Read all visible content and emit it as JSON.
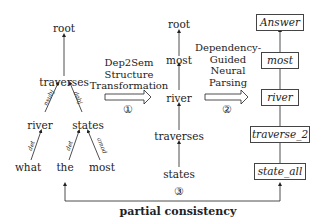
{
  "dependency_tree": {
    "nodes": {
      "root": "root",
      "traverses": "traverses",
      "river": "river",
      "states": "states",
      "what": "what",
      "the": "the",
      "most": "most"
    },
    "edges": {
      "nsubj": "nsubj",
      "dobj": "dobj",
      "det_what": "det",
      "det_the": "det",
      "amod": "amod"
    }
  },
  "step1": {
    "caption_line1": "Dep2Sem",
    "caption_line2": "Structure",
    "caption_line3": "Transformation",
    "number": "①"
  },
  "semantic_tree": {
    "nodes": [
      "root",
      "most",
      "river",
      "traverses",
      "states"
    ]
  },
  "step2": {
    "caption_line1": "Dependency-",
    "caption_line2": "Guided",
    "caption_line3": "Neural",
    "caption_line4": "Parsing",
    "number": "②"
  },
  "logical_form": {
    "nodes": [
      "Answer",
      "most",
      "river",
      "traverse_2",
      "state_all"
    ]
  },
  "step3": {
    "number": "③",
    "label": "partial consistency"
  }
}
